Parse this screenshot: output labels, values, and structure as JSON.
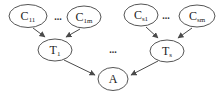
{
  "diagram": {
    "type": "directed-graph",
    "background_color": "#ffffff",
    "node_fill": "#ffffff",
    "node_stroke": "#555555",
    "edge_color": "#4a4a4a",
    "ellipsis": "...",
    "nodes": [
      {
        "id": "C11",
        "base": "C",
        "sub": "11"
      },
      {
        "id": "C1m",
        "base": "C",
        "sub": "1m"
      },
      {
        "id": "Cs1",
        "base": "C",
        "sub": "s1"
      },
      {
        "id": "Csm",
        "base": "C",
        "sub": "sm"
      },
      {
        "id": "T1",
        "base": "T",
        "sub": "1"
      },
      {
        "id": "Ts",
        "base": "T",
        "sub": "s"
      },
      {
        "id": "A",
        "base": "A",
        "sub": ""
      }
    ],
    "edges": [
      {
        "from": "C11",
        "to": "T1"
      },
      {
        "from": "C1m",
        "to": "T1"
      },
      {
        "from": "Cs1",
        "to": "Ts"
      },
      {
        "from": "Csm",
        "to": "Ts"
      },
      {
        "from": "T1",
        "to": "A"
      },
      {
        "from": "Ts",
        "to": "A"
      }
    ]
  }
}
